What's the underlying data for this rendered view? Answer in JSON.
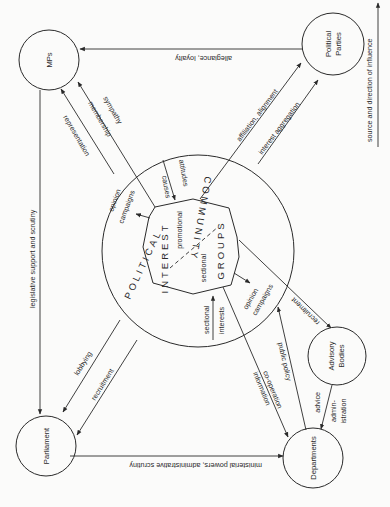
{
  "diagram": {
    "legend": {
      "label": "source and direction of influence"
    },
    "nodes": {
      "mps": "MPs",
      "parties_1": "Political",
      "parties_2": "Parties",
      "parliament": "Parliament",
      "departments": "Departments",
      "advisory_1": "Advisory",
      "advisory_2": "Bodies"
    },
    "centre": {
      "interest": "INTEREST",
      "groups": "GROUPS",
      "promotional": "promotional",
      "sectional": "sectional",
      "ring_political": "POLITICAL",
      "ring_community": "COMMUNITY"
    },
    "edges": {
      "allegiance": "allegiance, loyalty",
      "legislative": "legislative support and scrutiny",
      "ministerial": "ministerial powers, administrative scrutiny",
      "representation": "representation",
      "membership": "membership",
      "sympathy": "sympathy",
      "affiliation": "affiliation, alignment",
      "interest_aggregation": "interest aggregation",
      "lobbying": "lobbying",
      "recruitment_parl": "recruitment",
      "recruitment_adv": "recruitment",
      "information": "information",
      "cooperation": "co-operation",
      "public_policy": "public policy",
      "advice": "advice",
      "admin_1": "admin-",
      "admin_2": "istration",
      "causes": "causes",
      "attitudes": "attitudes",
      "opinion_1a": "opinion",
      "opinion_1b": "campaigns",
      "opinion_2a": "opinion",
      "opinion_2b": "campaigns",
      "sectional_interests_1": "sectional",
      "sectional_interests_2": "interests"
    }
  }
}
